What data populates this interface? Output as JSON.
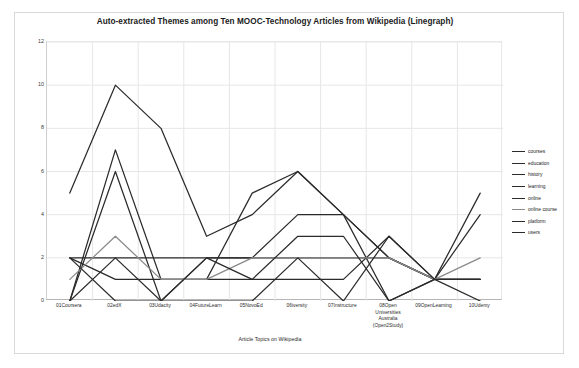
{
  "chart_data": {
    "type": "line",
    "title": "Auto-extracted Themes among Ten MOOC-Technology Articles from Wikipedia (Linegraph)",
    "xlabel": "Article Topics on Wikipedia",
    "ylabel": "Topic  Representation",
    "ylim": [
      0,
      12
    ],
    "yticks": [
      0,
      2,
      4,
      6,
      8,
      10,
      12
    ],
    "grid": true,
    "legend_position": "right",
    "categories": [
      "01Coursera",
      "02edX",
      "03Udacity",
      "04FutureLearn",
      "05NovoEd",
      "06iversity",
      "07Instructure",
      "08Open Universities Australia (Open2Study)",
      "09OpenLearning",
      "10Udemy"
    ],
    "category_lines": [
      [
        "01Coursera"
      ],
      [
        "02edX"
      ],
      [
        "03Udacity"
      ],
      [
        "04FutureLearn"
      ],
      [
        "05NovoEd"
      ],
      [
        "06iversity"
      ],
      [
        "07Instructure"
      ],
      [
        "08Open",
        "Universities",
        "Australia",
        "(Open2Study)"
      ],
      [
        "09OpenLearning"
      ],
      [
        "10Udemy"
      ]
    ],
    "series": [
      {
        "name": "courses",
        "color": "#2b2b2b",
        "values": [
          5,
          10,
          8,
          3,
          4,
          6,
          4,
          0,
          1,
          1
        ]
      },
      {
        "name": "education",
        "color": "#2b2b2b",
        "values": [
          0,
          7,
          1,
          1,
          5,
          6,
          4,
          2,
          1,
          5
        ]
      },
      {
        "name": "history",
        "color": "#2b2b2b",
        "values": [
          0,
          6,
          0,
          2,
          2,
          4,
          4,
          2,
          1,
          4
        ]
      },
      {
        "name": "learning",
        "color": "#2b2b2b",
        "values": [
          2,
          2,
          2,
          2,
          2,
          2,
          2,
          2,
          1,
          1
        ]
      },
      {
        "name": "online",
        "color": "#2b2b2b",
        "values": [
          2,
          1,
          1,
          1,
          1,
          1,
          1,
          3,
          1,
          1
        ]
      },
      {
        "name": "online course",
        "color": "#8a8a8a",
        "values": [
          1,
          3,
          1,
          1,
          2,
          2,
          2,
          2,
          1,
          2
        ]
      },
      {
        "name": "platform",
        "color": "#2b2b2b",
        "values": [
          2,
          0,
          0,
          2,
          1,
          3,
          3,
          0,
          1,
          0
        ]
      },
      {
        "name": "users",
        "color": "#2b2b2b",
        "values": [
          0,
          2,
          0,
          0,
          0,
          2,
          0,
          3,
          1,
          1
        ]
      }
    ]
  },
  "legend": {
    "items": [
      {
        "label": "courses"
      },
      {
        "label": "education"
      },
      {
        "label": "history"
      },
      {
        "label": "learning"
      },
      {
        "label": "online"
      },
      {
        "label": "online course"
      },
      {
        "label": "platform"
      },
      {
        "label": "users"
      }
    ]
  }
}
